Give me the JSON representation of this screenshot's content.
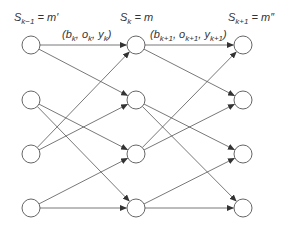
{
  "diagram": {
    "type": "trellis",
    "columns": [
      {
        "id": "k-1",
        "label": {
          "main": "S",
          "sub": "k−1",
          "rhs": " = m′"
        },
        "x": 31
      },
      {
        "id": "k",
        "label": {
          "main": "S",
          "sub": "k",
          "rhs": " = m"
        },
        "x": 136
      },
      {
        "id": "k+1",
        "label": {
          "main": "S",
          "sub": "k+1",
          "rhs": " = m″"
        },
        "x": 243
      }
    ],
    "rows_y": [
      45,
      100,
      154,
      208
    ],
    "node_radius": 9,
    "transition_labels": [
      {
        "text": "(b_k, o_k, y_k)",
        "parts": [
          [
            "(b",
            ""
          ],
          [
            "k",
            "sub"
          ],
          [
            ", o",
            ""
          ],
          [
            "k",
            "sub"
          ],
          [
            ", y",
            ""
          ],
          [
            "k",
            "sub"
          ],
          [
            ")",
            ""
          ]
        ],
        "x": 62,
        "y": 38
      },
      {
        "text": "(b_{k+1}, o_{k+1}, y_{k+1})",
        "parts": [
          [
            "(b",
            ""
          ],
          [
            "k+1",
            "sub"
          ],
          [
            ", o",
            ""
          ],
          [
            "k+1",
            "sub"
          ],
          [
            ", y",
            ""
          ],
          [
            "k+1",
            "sub"
          ],
          [
            ")",
            ""
          ]
        ],
        "x": 150,
        "y": 38
      }
    ],
    "edges_per_stage": [
      [
        0,
        0
      ],
      [
        0,
        1
      ],
      [
        1,
        2
      ],
      [
        1,
        3
      ],
      [
        2,
        0
      ],
      [
        2,
        1
      ],
      [
        3,
        2
      ],
      [
        3,
        3
      ]
    ],
    "colors": {
      "stroke": "#555555",
      "text": "#333333",
      "background": "#ffffff"
    }
  }
}
